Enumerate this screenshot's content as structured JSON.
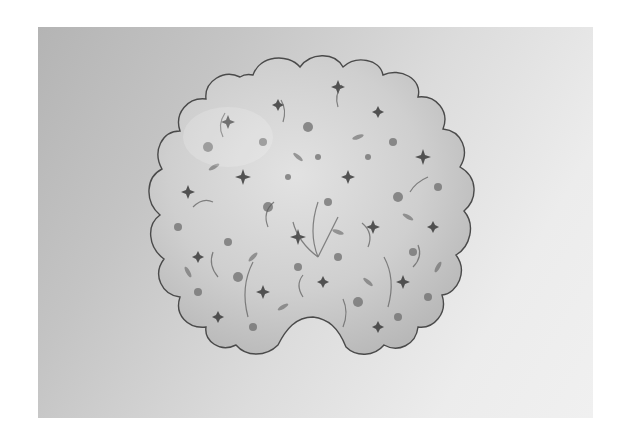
{
  "image": {
    "subject": "Scalloped shell-shaped ceramic dish with dense floral decoration",
    "style": "grayscale photograph",
    "colors": {
      "border": "#ffffff",
      "background_dark": "#b4b4b4",
      "background_light": "#f0f0f0",
      "dish_base": "#d8d8d8",
      "dish_rim": "#4a4a4a",
      "flower_dark": "#3a3a3a",
      "flower_mid": "#6e6e6e",
      "leaf": "#5a5a5a"
    },
    "caption": "Shell-shaped floral dish"
  }
}
